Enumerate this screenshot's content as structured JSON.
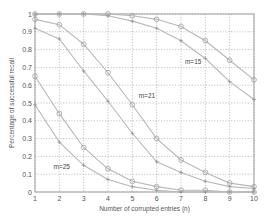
{
  "chart_data": {
    "type": "line",
    "title": "",
    "xlabel": "Number of corrupted entries (n)",
    "ylabel": "Percentage of successful recall",
    "xlim": [
      1,
      10
    ],
    "ylim": [
      0,
      1
    ],
    "xticks": [
      "1",
      "2",
      "3",
      "4",
      "5",
      "6",
      "7",
      "8",
      "9",
      "10"
    ],
    "yticks": [
      "0",
      "0.1",
      "0.2",
      "0.3",
      "0.4",
      "0.5",
      "0.6",
      "0.7",
      "0.8",
      "0.9",
      "1"
    ],
    "grid": true,
    "x": [
      1,
      2,
      3,
      4,
      5,
      6,
      7,
      8,
      9,
      10
    ],
    "series": [
      {
        "name": "m=15 (o)",
        "marker": "circle",
        "values": [
          1.0,
          1.0,
          1.0,
          1.0,
          0.99,
          0.97,
          0.93,
          0.85,
          0.74,
          0.63
        ]
      },
      {
        "name": "m=15 (+)",
        "marker": "plus",
        "values": [
          1.0,
          1.0,
          1.0,
          0.99,
          0.96,
          0.92,
          0.85,
          0.75,
          0.62,
          0.52
        ]
      },
      {
        "name": "m=21 (o)",
        "marker": "circle",
        "values": [
          0.97,
          0.94,
          0.83,
          0.67,
          0.49,
          0.3,
          0.18,
          0.11,
          0.05,
          0.03
        ]
      },
      {
        "name": "m=21 (+)",
        "marker": "plus",
        "values": [
          0.92,
          0.86,
          0.68,
          0.51,
          0.33,
          0.17,
          0.11,
          0.06,
          0.03,
          0.02
        ]
      },
      {
        "name": "m=25 (o)",
        "marker": "circle",
        "values": [
          0.65,
          0.44,
          0.25,
          0.13,
          0.06,
          0.03,
          0.01,
          0.01,
          0.0,
          0.0
        ]
      },
      {
        "name": "m=25 (+)",
        "marker": "plus",
        "values": [
          0.49,
          0.28,
          0.15,
          0.07,
          0.03,
          0.01,
          0.0,
          0.0,
          0.0,
          0.0
        ]
      }
    ],
    "annotations": [
      {
        "text": "m=15",
        "x": 7.5,
        "y": 0.72
      },
      {
        "text": "m=21",
        "x": 5.6,
        "y": 0.53
      },
      {
        "text": "m=25",
        "x": 2.1,
        "y": 0.13
      }
    ],
    "line_color": "#b8b8b8",
    "grid_color": "#9a9a9a"
  }
}
